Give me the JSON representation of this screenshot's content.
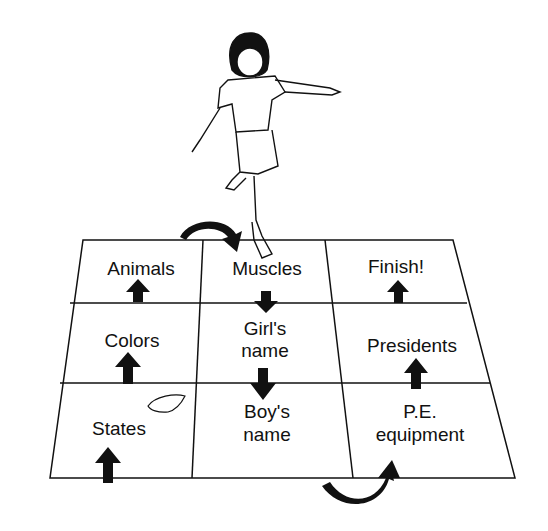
{
  "diagram": {
    "colors": {
      "ink": "#111111",
      "background": "#ffffff"
    },
    "cells": [
      {
        "row": 0,
        "col": 0,
        "label": "Animals",
        "x": 141,
        "y": 258
      },
      {
        "row": 0,
        "col": 1,
        "label": "Muscles",
        "x": 267,
        "y": 258
      },
      {
        "row": 0,
        "col": 2,
        "label": "Finish!",
        "x": 396,
        "y": 258
      },
      {
        "row": 1,
        "col": 0,
        "label": "Colors",
        "x": 132,
        "y": 330
      },
      {
        "row": 1,
        "col": 1,
        "label": "Girl's",
        "label2": "name",
        "x": 265,
        "y": 318
      },
      {
        "row": 1,
        "col": 2,
        "label": "Presidents",
        "x": 412,
        "y": 335
      },
      {
        "row": 2,
        "col": 0,
        "label": "States",
        "x": 119,
        "y": 418
      },
      {
        "row": 2,
        "col": 1,
        "label": "Boy's",
        "label2": "name",
        "x": 267,
        "y": 401
      },
      {
        "row": 2,
        "col": 2,
        "label": "P.E.",
        "label2": "equipment",
        "x": 420,
        "y": 401
      }
    ],
    "arrows": [
      {
        "from": "States",
        "to": "Colors",
        "direction": "up"
      },
      {
        "from": "Colors",
        "to": "Animals",
        "direction": "up"
      },
      {
        "from": "Animals",
        "to": "Muscles",
        "direction": "curved-right"
      },
      {
        "from": "Muscles",
        "to": "Girl's name",
        "direction": "down"
      },
      {
        "from": "Girl's name",
        "to": "Boy's name",
        "direction": "down"
      },
      {
        "from": "Boy's name",
        "to": "P.E. equipment",
        "direction": "curved-right"
      },
      {
        "from": "P.E. equipment",
        "to": "Presidents",
        "direction": "up"
      },
      {
        "from": "Presidents",
        "to": "Finish!",
        "direction": "up"
      }
    ],
    "figures": [
      "girl-hopping",
      "beanbag-marker"
    ]
  }
}
